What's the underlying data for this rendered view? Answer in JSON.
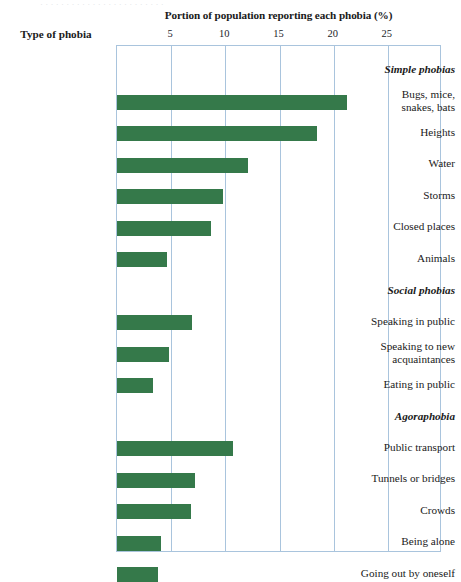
{
  "scan_artifact": "· · · · · · · · · · · · · · · · · · · · · · · ·",
  "header": {
    "category_column_title": "Type of phobia"
  },
  "chart_data": {
    "type": "bar",
    "orientation": "horizontal",
    "title": "Portion of population reporting each phobia (%)",
    "xlabel": "Portion of population reporting each phobia (%)",
    "ylabel": "Type of phobia",
    "xlim": [
      0,
      30
    ],
    "xticks": [
      5,
      10,
      15,
      20,
      25
    ],
    "xtick_labels": [
      "5",
      "10",
      "15",
      "20",
      "25"
    ],
    "grid": true,
    "grid_axis": "x",
    "legend": "none",
    "bar_color": "#35794a",
    "frame_color": "#a9c4dd",
    "groups": [
      {
        "name": "Simple phobias",
        "items": [
          {
            "label": "Bugs, mice,\nsnakes, bats",
            "label_lines": [
              "Bugs, mice,",
              "snakes, bats"
            ],
            "value": 21.2
          },
          {
            "label": "Heights",
            "label_lines": [
              "Heights"
            ],
            "value": 18.5
          },
          {
            "label": "Water",
            "label_lines": [
              "Water"
            ],
            "value": 12.1
          },
          {
            "label": "Storms",
            "label_lines": [
              "Storms"
            ],
            "value": 9.8
          },
          {
            "label": "Closed places",
            "label_lines": [
              "Closed places"
            ],
            "value": 8.7
          },
          {
            "label": "Animals",
            "label_lines": [
              "Animals"
            ],
            "value": 4.6
          }
        ]
      },
      {
        "name": "Social phobias",
        "items": [
          {
            "label": "Speaking in public",
            "label_lines": [
              "Speaking in public"
            ],
            "value": 6.9
          },
          {
            "label": "Speaking to new\nacquaintances",
            "label_lines": [
              "Speaking to new",
              "acquaintances"
            ],
            "value": 4.8
          },
          {
            "label": "Eating in public",
            "label_lines": [
              "Eating in public"
            ],
            "value": 3.3
          }
        ]
      },
      {
        "name": "Agoraphobia",
        "items": [
          {
            "label": "Public transport",
            "label_lines": [
              "Public transport"
            ],
            "value": 10.7
          },
          {
            "label": "Tunnels or bridges",
            "label_lines": [
              "Tunnels or bridges"
            ],
            "value": 7.2
          },
          {
            "label": "Crowds",
            "label_lines": [
              "Crowds"
            ],
            "value": 6.8
          },
          {
            "label": "Being alone",
            "label_lines": [
              "Being alone"
            ],
            "value": 4.1
          },
          {
            "label": "Going out by oneself",
            "label_lines": [
              "Going out by oneself"
            ],
            "value": 3.8
          }
        ]
      }
    ]
  }
}
